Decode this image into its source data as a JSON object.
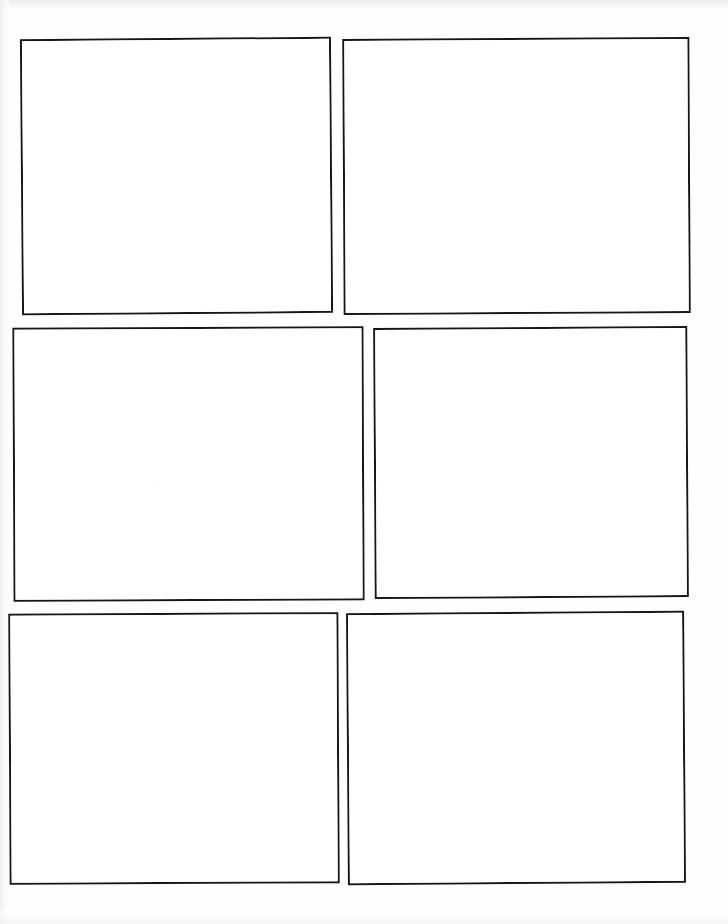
{
  "document": {
    "kind": "blank-comic-page",
    "title": "Blank Comic Book Panel Template",
    "page_width": 728,
    "page_height": 924,
    "background_color": "#fefefe",
    "paper_color": "#ffffff",
    "ink_color": "#161616",
    "panel_count": 6,
    "rows": 3,
    "columns": 2,
    "gutter_style": "white",
    "panel_content": ""
  },
  "panels": [
    {
      "id": "panel-1",
      "label": "Panel 1",
      "row": 1,
      "column": 1,
      "content": "",
      "x": 21,
      "y": 38,
      "width": 311,
      "height": 276,
      "rotation": -0.45,
      "border_width": 2.5,
      "border_color": "#161616",
      "fill_color": "#ffffff"
    },
    {
      "id": "panel-2",
      "label": "Panel 2",
      "row": 1,
      "column": 2,
      "content": "",
      "x": 343,
      "y": 38,
      "width": 347,
      "height": 276,
      "rotation": -0.3,
      "border_width": 2.5,
      "border_color": "#161616",
      "fill_color": "#ffffff"
    },
    {
      "id": "panel-3",
      "label": "Panel 3",
      "row": 2,
      "column": 1,
      "content": "",
      "x": 13,
      "y": 327,
      "width": 351,
      "height": 274,
      "rotation": -0.25,
      "border_width": 2.5,
      "border_color": "#161616",
      "fill_color": "#ffffff"
    },
    {
      "id": "panel-4",
      "label": "Panel 4",
      "row": 2,
      "column": 2,
      "content": "",
      "x": 374,
      "y": 327,
      "width": 314,
      "height": 271,
      "rotation": -0.35,
      "border_width": 2.5,
      "border_color": "#161616",
      "fill_color": "#ffffff"
    },
    {
      "id": "panel-5",
      "label": "Panel 5",
      "row": 3,
      "column": 1,
      "content": "",
      "x": 9,
      "y": 613,
      "width": 330,
      "height": 271,
      "rotation": -0.3,
      "border_width": 2.5,
      "border_color": "#161616",
      "fill_color": "#ffffff"
    },
    {
      "id": "panel-6",
      "label": "Panel 6",
      "row": 3,
      "column": 2,
      "content": "",
      "x": 347,
      "y": 612,
      "width": 338,
      "height": 272,
      "rotation": -0.4,
      "border_width": 2.5,
      "border_color": "#161616",
      "fill_color": "#ffffff"
    }
  ]
}
